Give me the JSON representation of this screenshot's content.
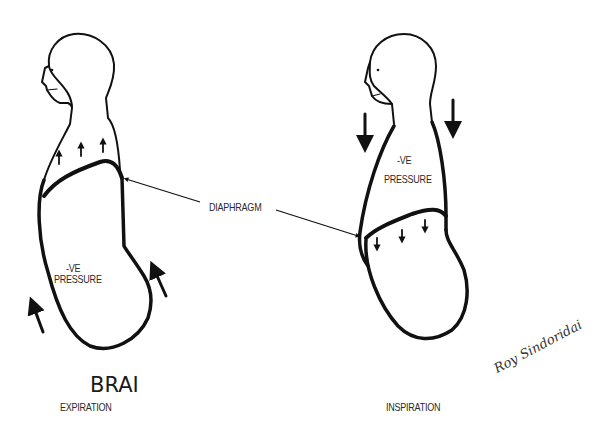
{
  "figure": {
    "left_panel": {
      "title": "BRAI",
      "caption": "EXPIRATION",
      "pressure_label_line1": "-VE",
      "pressure_label_line2": "PRESSURE",
      "arrows": [
        "up",
        "up",
        "up",
        "up-outside-front",
        "up-outside-back"
      ]
    },
    "right_panel": {
      "caption": "INSPIRATION",
      "pressure_label_line1": "-VE",
      "pressure_label_line2": "PRESSURE",
      "arrows": [
        "down",
        "down",
        "down",
        "down-outside-front",
        "down-outside-back"
      ]
    },
    "shared_label": "DIAPHRAGM",
    "signature": "Roy Sindoridai",
    "colors": {
      "ink": "#111111",
      "background": "#ffffff",
      "text": "#2a2a2a"
    }
  }
}
